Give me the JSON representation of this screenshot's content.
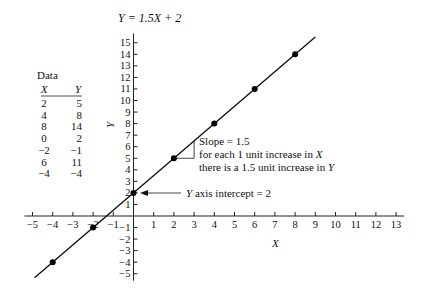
{
  "title": "Y = 1.5X + 2",
  "data_table": {
    "title": "Data",
    "headers": [
      "X",
      "Y"
    ],
    "rows": [
      [
        "2",
        "5"
      ],
      [
        "4",
        "8"
      ],
      [
        "8",
        "14"
      ],
      [
        "0",
        "2"
      ],
      [
        "−2",
        "−1"
      ],
      [
        "6",
        "11"
      ],
      [
        "−4",
        "−4"
      ]
    ]
  },
  "annotations": {
    "slope_line1": "Slope = 1.5",
    "slope_line2": "for each 1 unit increase in X",
    "slope_line3": "there is a 1.5 unit increase in Y",
    "intercept": "Y axis intercept = 2"
  },
  "chart_data": {
    "type": "line",
    "title": "Y = 1.5X + 2",
    "xlabel": "X",
    "ylabel": "Y",
    "xlim": [
      -5,
      13
    ],
    "ylim": [
      -5,
      15
    ],
    "x_ticks": [
      -5,
      -4,
      -3,
      -2,
      -1,
      1,
      2,
      3,
      4,
      5,
      6,
      7,
      8,
      9,
      10,
      11,
      12,
      13
    ],
    "y_ticks": [
      -5,
      -4,
      -3,
      -2,
      -1,
      1,
      2,
      3,
      4,
      5,
      6,
      7,
      8,
      9,
      10,
      11,
      12,
      13,
      14,
      15
    ],
    "grid": false,
    "series": [
      {
        "name": "Y = 1.5X + 2",
        "slope": 1.5,
        "intercept": 2,
        "x": [
          -4,
          -2,
          0,
          2,
          4,
          6,
          8
        ],
        "y": [
          -4,
          -1,
          2,
          5,
          8,
          11,
          14
        ]
      }
    ],
    "line_extent": {
      "x": [
        -4.9,
        9.0
      ],
      "y": [
        -5.35,
        15.5
      ]
    },
    "annotations": [
      "Slope = 1.5 — for each 1 unit increase in X there is a 1.5 unit increase in Y",
      "Y axis intercept = 2"
    ]
  }
}
